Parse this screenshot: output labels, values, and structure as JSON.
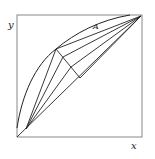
{
  "diagram": {
    "type": "x-y composition diagram",
    "labels": {
      "y_axis": "y",
      "x_axis": "x",
      "region": "A"
    },
    "colors": {
      "stroke": "#222222",
      "frame": "#888888",
      "background": "#ffffff"
    },
    "frame": {
      "x0": 17,
      "y0": 15,
      "x1": 142,
      "y1": 137
    },
    "points": {
      "origin": [
        17,
        137
      ],
      "top_right": [
        141,
        16
      ],
      "lower_pivot": [
        26,
        129
      ],
      "upper_vertex": [
        56,
        49
      ],
      "tie_mid1": [
        63,
        57
      ],
      "tie_mid2": [
        71,
        67
      ],
      "tie_end": [
        80,
        78
      ]
    },
    "curves": {
      "outer_curve": "M17,128 C22,95 35,65 56,49 C75,33 100,20 130,15",
      "diagonal": "M17,137 L141,16"
    },
    "fan_lines_to_top_right": [
      [
        56,
        49
      ],
      [
        63,
        57
      ],
      [
        71,
        67
      ],
      [
        80,
        78
      ]
    ],
    "fan_lines_from_lower_pivot": [
      [
        56,
        49
      ],
      [
        63,
        57
      ],
      [
        71,
        67
      ]
    ],
    "tie_line": [
      [
        56,
        49
      ],
      [
        80,
        78
      ]
    ]
  }
}
